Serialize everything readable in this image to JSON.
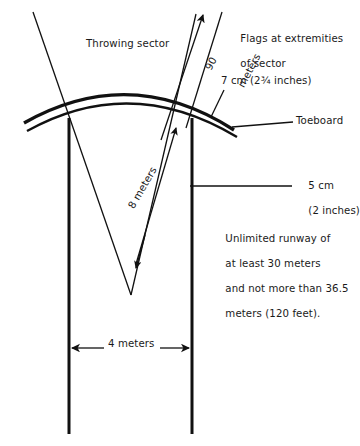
{
  "figure": {
    "stroke_color": "#111111",
    "background_color": "#ffffff"
  },
  "labels": {
    "throwing_sector": "Throwing sector",
    "flags_line1": "Flags at extremities",
    "flags_line2": "of sector",
    "toeboard": "Toeboard",
    "seven_cm": "7 cm (2¾ inches)",
    "five_cm_line1": "5 cm",
    "five_cm_line2": "(2 inches)",
    "ninety_value": "90",
    "ninety_unit": "meters",
    "eight_meters": "8 meters",
    "four_meters": "4 meters",
    "runway_line1": "Unlimited runway of",
    "runway_line2": "at least 30 meters",
    "runway_line3": "and not more than 36.5",
    "runway_line4": "meters (120 feet)."
  },
  "measurements": {
    "sector_radius": "90 meters",
    "arc_radius": "8 meters",
    "runway_width": "4 meters",
    "toeboard_height": "7 cm (2¾ inches)",
    "runway_line_width": "5 cm (2 inches)",
    "runway_min_length": "30 meters",
    "runway_max_length": "36.5 meters (120 feet)"
  }
}
